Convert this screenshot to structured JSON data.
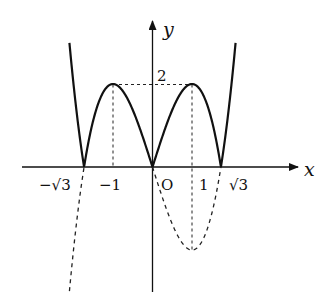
{
  "diagram": {
    "type": "function-graph",
    "axes": {
      "x_label": "x",
      "y_label": "y",
      "origin_label": "O"
    },
    "x_ticks": [
      {
        "value": -1.7320508,
        "label": "−√3"
      },
      {
        "value": -1,
        "label": "−1"
      },
      {
        "value": 1,
        "label": "1"
      },
      {
        "value": 1.7320508,
        "label": "√3"
      }
    ],
    "y_ticks": [
      {
        "value": 2,
        "label": "2"
      }
    ],
    "guides": {
      "horizontal_at_y": 2,
      "from_x": -1,
      "to_x": 1,
      "verticals_at_x": [
        -1,
        1
      ]
    },
    "curves": {
      "solid": "y = |x^3 - 3x|",
      "dashed": "y = x^3 - 3x (parts below x-axis)"
    },
    "key_points": {
      "local_max_left": [
        -1,
        2
      ],
      "local_max_right": [
        1,
        2
      ],
      "dashed_min": [
        1,
        -2
      ],
      "roots": [
        "−√3",
        "0",
        "√3"
      ]
    },
    "colors": {
      "curve": "#111111",
      "axes": "#111111",
      "background": "#ffffff"
    }
  }
}
